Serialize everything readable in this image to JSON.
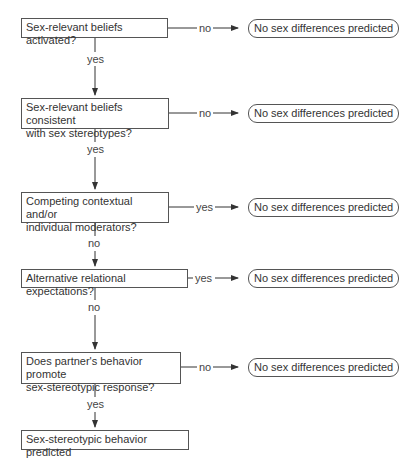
{
  "flowchart": {
    "nodes": [
      {
        "id": "q1",
        "text": "Sex-relevant beliefs activated?"
      },
      {
        "id": "q2",
        "text": "Sex-relevant beliefs consistent with sex stereotypes?",
        "line1": "Sex-relevant beliefs consistent",
        "line2": "with sex stereotypes?"
      },
      {
        "id": "q3",
        "text": "Competing contextual and/or individual moderators?",
        "line1": "Competing contextual and/or",
        "line2": "individual moderators?"
      },
      {
        "id": "q4",
        "text": "Alternative relational expectations?"
      },
      {
        "id": "q5",
        "text": "Does partner's behavior promote sex-stereotypic response?",
        "line1": "Does partner's behavior promote",
        "line2": "sex-stereotypic response?"
      },
      {
        "id": "end",
        "text": "Sex-stereotypic behavior predicted"
      }
    ],
    "outcomes": [
      {
        "from": "q1",
        "edge": "no",
        "text": "No sex differences predicted"
      },
      {
        "from": "q2",
        "edge": "no",
        "text": "No sex differences predicted"
      },
      {
        "from": "q3",
        "edge": "yes",
        "text": "No sex differences predicted"
      },
      {
        "from": "q4",
        "edge": "yes",
        "text": "No sex differences predicted"
      },
      {
        "from": "q5",
        "edge": "no",
        "text": "No sex differences predicted"
      }
    ],
    "down_edges": [
      {
        "from": "q1",
        "to": "q2",
        "label": "yes"
      },
      {
        "from": "q2",
        "to": "q3",
        "label": "yes"
      },
      {
        "from": "q3",
        "to": "q4",
        "label": "no"
      },
      {
        "from": "q4",
        "to": "q5",
        "label": "no"
      },
      {
        "from": "q5",
        "to": "end",
        "label": "yes"
      }
    ]
  }
}
